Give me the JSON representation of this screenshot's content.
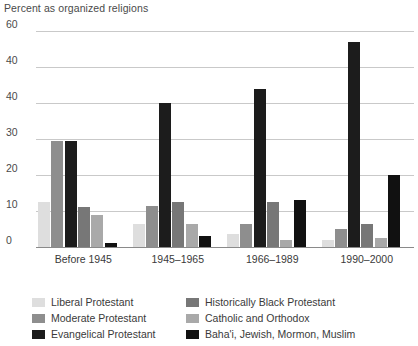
{
  "chart_data": {
    "type": "bar",
    "title": "Percent as organized religions",
    "subtitle": "",
    "xlabel": "",
    "ylabel": "",
    "ylim": [
      0,
      60
    ],
    "yticks": [
      "0",
      "10",
      "20",
      "30",
      "40",
      "40",
      "60"
    ],
    "grid": true,
    "legend_position": "bottom",
    "categories": [
      "Before 1945",
      "1945–1965",
      "1966–1989",
      "1990–2000"
    ],
    "series": [
      {
        "name": "Liberal Protestant",
        "color": "#dedede",
        "values": [
          12.5,
          6.5,
          3.5,
          2.0
        ]
      },
      {
        "name": "Moderate Protestant",
        "color": "#8e8e8e",
        "values": [
          29.5,
          11.5,
          6.5,
          5.0
        ]
      },
      {
        "name": "Evangelical Protestant",
        "color": "#1c1c1c",
        "values": [
          29.5,
          40.0,
          44.0,
          57.0
        ]
      },
      {
        "name": "Historically Black Protestant",
        "color": "#777777",
        "values": [
          11.0,
          12.5,
          12.5,
          6.5
        ]
      },
      {
        "name": "Catholic and Orthodox",
        "color": "#a9a9a9",
        "values": [
          9.0,
          6.5,
          2.0,
          2.5
        ]
      },
      {
        "name": "Baha'i, Jewish, Mormon, Muslim",
        "color": "#111111",
        "values": [
          1.0,
          3.0,
          13.0,
          20.0
        ]
      }
    ]
  },
  "legend": {
    "items": [
      {
        "label": "Liberal Protestant"
      },
      {
        "label": "Historically Black Protestant"
      },
      {
        "label": "Moderate Protestant"
      },
      {
        "label": "Catholic and Orthodox"
      },
      {
        "label": "Evangelical Protestant"
      },
      {
        "label": "Baha'i, Jewish, Mormon, Muslim"
      }
    ]
  }
}
